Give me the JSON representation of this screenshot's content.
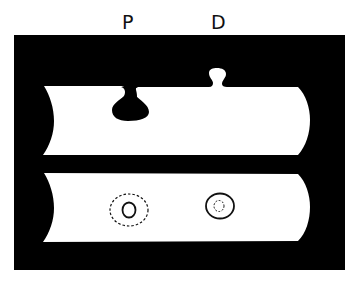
{
  "labels": {
    "p": "P",
    "d": "D"
  },
  "colors": {
    "background": "#ffffff",
    "frame": "#000000",
    "tube": "#ffffff",
    "outline": "#111111"
  },
  "figure": {
    "panels": [
      {
        "name": "top",
        "description": "Tube with invagination at P (dark bulb inward) and evagination at D (small knob outward)"
      },
      {
        "name": "bottom",
        "description": "Tube with concentric rings at P (solid inner, dashed outer) and D (solid outer, dashed inner)"
      }
    ]
  }
}
